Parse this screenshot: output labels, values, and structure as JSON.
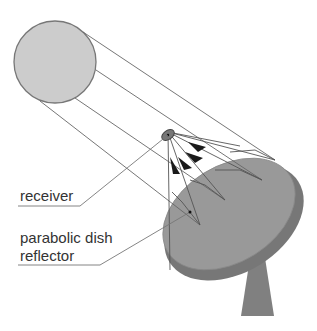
{
  "diagram": {
    "labels": {
      "receiver": "receiver",
      "reflector_line1": "parabolic dish",
      "reflector_line2": "reflector"
    },
    "components": [
      "sun",
      "incoming-rays",
      "receiver",
      "reflected-rays",
      "parabolic-dish-reflector",
      "support-pedestal"
    ],
    "colors": {
      "sun_fill": "#cccccc",
      "sun_stroke": "#777777",
      "dish_face": "#999999",
      "dish_rim": "#777777",
      "pedestal": "#808080",
      "ray": "#666666",
      "arrow": "#1a1a1a",
      "text": "#333333"
    }
  }
}
